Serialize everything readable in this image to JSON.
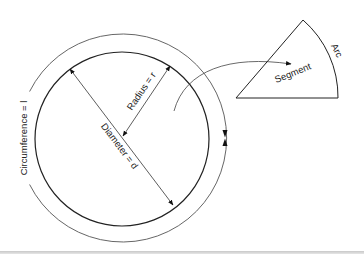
{
  "diagram": {
    "labels": {
      "circumference": "Circumference = l",
      "radius": "Radius = r",
      "diameter": "Diameter = d",
      "segment": "Segment",
      "arc": "Arc"
    },
    "colors": {
      "stroke": "#222222",
      "outer_stroke": "#555555",
      "background": "#ffffff",
      "bottom_rule": "#c8c8c8"
    },
    "geometry": {
      "inner_circle": {
        "cx": 122,
        "cy": 139,
        "r": 87
      },
      "outer_circle": {
        "cx": 122,
        "cy": 138,
        "r": 104
      },
      "segment": {
        "center": [
          236,
          98
        ],
        "top": [
          303,
          20
        ],
        "right": [
          338,
          98
        ]
      }
    }
  }
}
